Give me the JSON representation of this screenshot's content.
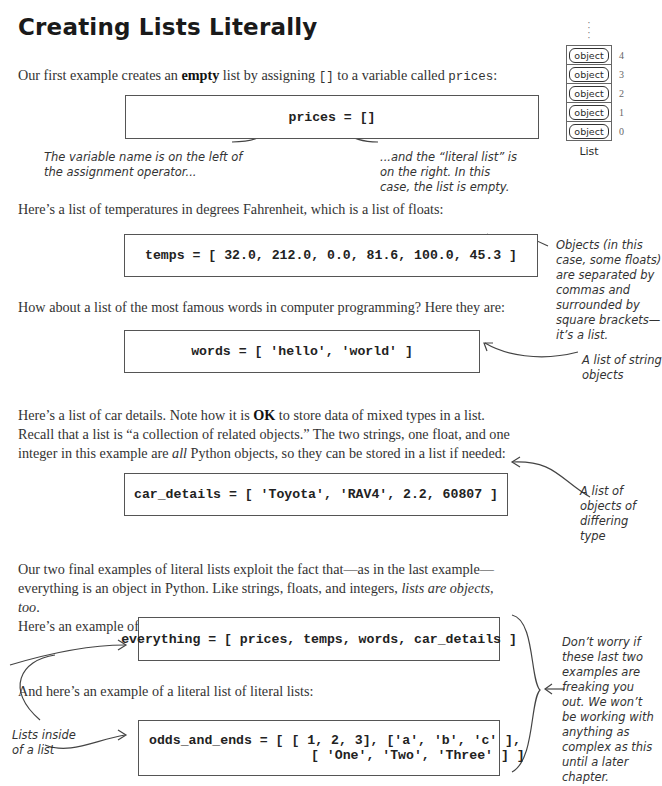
{
  "title": "Creating Lists Literally",
  "intro": {
    "before": "Our first example creates an ",
    "bold": "empty",
    "middle": " list by assigning ",
    "code": "[]",
    "after": " to a variable called ",
    "code2": "prices",
    "end": ":"
  },
  "code": {
    "prices": "prices = []",
    "temps": "temps = [ 32.0, 212.0, 0.0, 81.6, 100.0, 45.3 ]",
    "words": "words = [ 'hello', 'world' ]",
    "car_details": "car_details = [ 'Toyota', 'RAV4', 2.2, 60807 ]",
    "everything": "everything = [ prices, temps, words, car_details ]",
    "odds_line1": "odds_and_ends = [ [ 1, 2, 3], ['a', 'b', 'c' ],",
    "odds_line2": "[ 'One', 'Two', 'Three' ] ]"
  },
  "paragraphs": {
    "temps": "Here’s a list of temperatures in degrees Fahrenheit, which is a list of floats:",
    "words": "How about a list of the most famous words in computer programming? Here they are:",
    "car1_a": "Here’s a list of car details. Note how it is ",
    "car1_b": "OK",
    "car1_c": " to store data of mixed types in a list.",
    "car2": "Recall that a list is “a collection of related objects.” The two strings, one float, and one",
    "car3_a": "integer in this example are ",
    "car3_b": "all",
    "car3_c": " Python objects, so they can be stored in a list if needed:",
    "final1": "Our two final examples of literal lists exploit the fact that—as in the last example—",
    "final2_a": "everything is an object in Python. Like strings, floats, and integers, ",
    "final2_b": "lists are objects, too",
    "final2_c": ".",
    "final3": "Here’s an example of a list of list objects:",
    "nested": "And here’s an example of a literal list of literal lists:"
  },
  "annotations": {
    "variable_name": "The variable name is on the left of the assignment operator...",
    "literal_list": "...and the “literal list” is on the right. In this case, the list is empty.",
    "objects_separated": "Objects (in this case, some floats) are separated by commas and surrounded by square brackets—it’s a list.",
    "string_objects": "A list of string objects",
    "differing_type": "A list of objects of differing type",
    "lists_inside": "Lists inside of a list",
    "dont_worry": "Don’t worry if these last two examples are freaking you out. We won’t be working with anything as complex as this until a later chapter."
  },
  "diagram": {
    "label": "List",
    "slot_label": "object",
    "indices": [
      "4",
      "3",
      "2",
      "1",
      "0"
    ]
  }
}
